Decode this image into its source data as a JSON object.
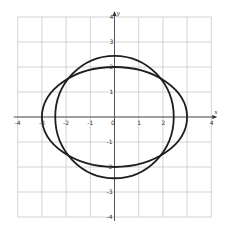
{
  "chart_data": {
    "type": "line",
    "title": "",
    "xlabel": "x",
    "ylabel": "y",
    "xlim": [
      -4,
      4
    ],
    "ylim": [
      -4,
      4
    ],
    "grid": true,
    "legend": null,
    "x_ticks": [
      "-4",
      "-3",
      "-2",
      "-1",
      "0",
      "1",
      "2",
      "4"
    ],
    "y_ticks": [
      "4",
      "3",
      "2",
      "1",
      "-1",
      "-2",
      "-3",
      "-4"
    ],
    "series": [
      {
        "name": "ellipse",
        "equation": "x^2/9 + y^2/4 = 1",
        "center": [
          0,
          0
        ],
        "rx": 3,
        "ry": 2
      },
      {
        "name": "circle",
        "equation": "x^2 + y^2 = 6",
        "center": [
          0,
          0
        ],
        "rx": 2.449,
        "ry": 2.449
      }
    ],
    "intersections": [
      [
        2,
        1.49
      ],
      [
        -2,
        1.49
      ],
      [
        2,
        -1.49
      ],
      [
        -2,
        -1.49
      ]
    ]
  },
  "view": {
    "origin_px": [
      114.5,
      117
    ],
    "scale_x": 24.2,
    "scale_y": 25,
    "colors": {
      "grid": "#c8c8c8",
      "axis": "#555555",
      "curve": "#1e1e1e",
      "background": "#ffffff"
    }
  }
}
